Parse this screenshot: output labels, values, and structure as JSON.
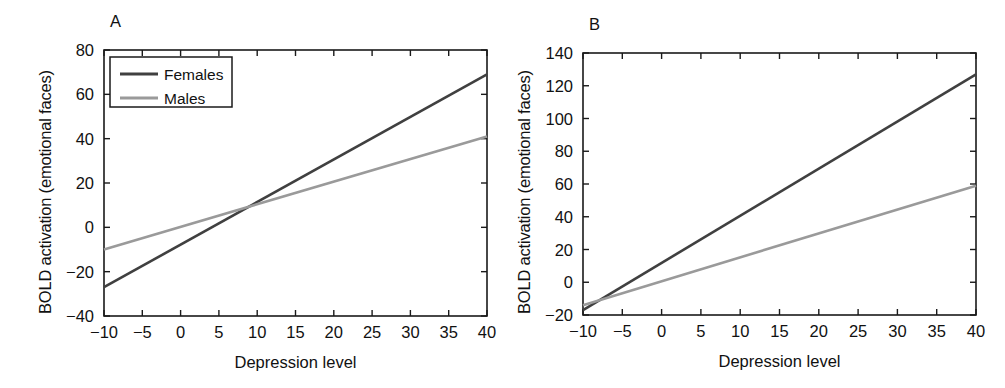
{
  "figure": {
    "background_color": "#ffffff",
    "panels": [
      "A",
      "B"
    ]
  },
  "colors": {
    "females_line": "#404040",
    "males_line": "#9a9a9a",
    "axis": "#1a1a1a",
    "text": "#111111"
  },
  "panel_a": {
    "letter": "A",
    "xlabel": "Depression level",
    "ylabel": "BOLD activation (emotional faces)",
    "xticks": [
      "-10",
      "-5",
      "0",
      "5",
      "10",
      "15",
      "20",
      "25",
      "30",
      "35",
      "40"
    ],
    "yticks": [
      "-40",
      "-20",
      "0",
      "20",
      "40",
      "60",
      "80"
    ],
    "legend": {
      "females_label": "Females",
      "males_label": "Males"
    }
  },
  "panel_b": {
    "letter": "B",
    "xlabel": "Depression level",
    "ylabel": "BOLD activation (emotional faces)",
    "xticks": [
      "-10",
      "-5",
      "0",
      "5",
      "10",
      "15",
      "20",
      "25",
      "30",
      "35",
      "40"
    ],
    "yticks": [
      "-20",
      "0",
      "20",
      "40",
      "60",
      "80",
      "100",
      "120",
      "140"
    ]
  },
  "chart_data": [
    {
      "type": "line",
      "panel": "A",
      "title": "A",
      "xlabel": "Depression level",
      "ylabel": "BOLD activation (emotional faces)",
      "xlim": [
        -10,
        40
      ],
      "ylim": [
        -40,
        80
      ],
      "xticks": [
        -10,
        -5,
        0,
        5,
        10,
        15,
        20,
        25,
        30,
        35,
        40
      ],
      "yticks": [
        -40,
        -20,
        0,
        20,
        40,
        60,
        80
      ],
      "grid": false,
      "legend_position": "upper left",
      "series": [
        {
          "name": "Females",
          "color": "#404040",
          "x": [
            -10,
            40
          ],
          "values": [
            -27,
            69
          ],
          "slope": 1.92,
          "intercept": -7.8
        },
        {
          "name": "Males",
          "color": "#9a9a9a",
          "x": [
            -10,
            40
          ],
          "values": [
            -10,
            41
          ],
          "slope": 1.02,
          "intercept": 0.2
        }
      ],
      "annotations": [
        "Lines cross near Depression level = 8.5, BOLD = 8.9"
      ]
    },
    {
      "type": "line",
      "panel": "B",
      "title": "B",
      "xlabel": "Depression level",
      "ylabel": "BOLD activation (emotional faces)",
      "xlim": [
        -10,
        40
      ],
      "ylim": [
        -20,
        140
      ],
      "xticks": [
        -10,
        -5,
        0,
        5,
        10,
        15,
        20,
        25,
        30,
        35,
        40
      ],
      "yticks": [
        -20,
        0,
        20,
        40,
        60,
        80,
        100,
        120,
        140
      ],
      "grid": false,
      "legend_position": "none",
      "series": [
        {
          "name": "Females",
          "color": "#404040",
          "x": [
            -10,
            40
          ],
          "values": [
            -17,
            127
          ],
          "slope": 2.88,
          "intercept": 11.8
        },
        {
          "name": "Males",
          "color": "#9a9a9a",
          "x": [
            -10,
            40
          ],
          "values": [
            -14,
            59
          ],
          "slope": 1.46,
          "intercept": 0.6
        }
      ],
      "annotations": [
        "Lines nearly coincide at the left edge (Depression level = -10)"
      ]
    }
  ]
}
